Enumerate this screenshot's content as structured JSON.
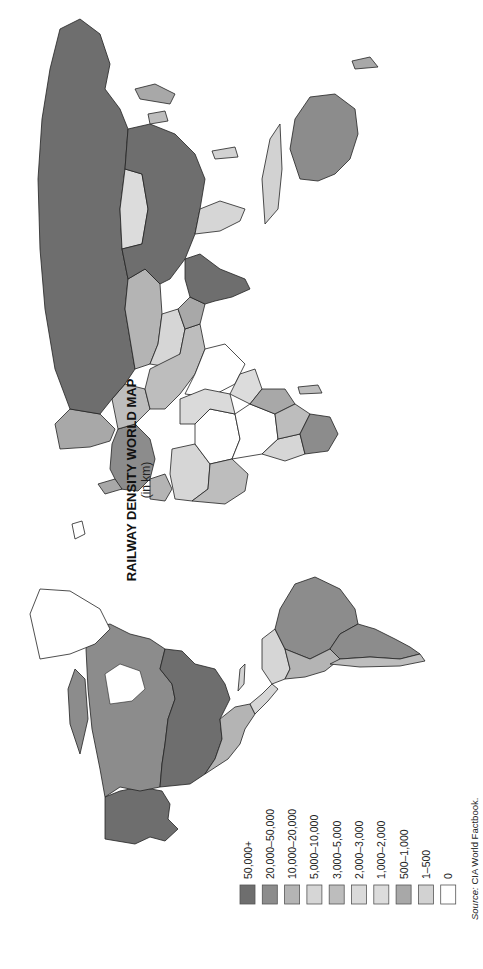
{
  "map": {
    "title": "RAILWAY DENSITY WORLD MAP",
    "subtitle": "(in km)",
    "orientation": "rotated 90° counter-clockwise",
    "source_prefix": "Source:",
    "source_text": " CIA World Factbook."
  },
  "legend": {
    "items": [
      {
        "label": "50,000+",
        "color": "#6e6e6e"
      },
      {
        "label": "20,000–50,000",
        "color": "#8c8c8c"
      },
      {
        "label": "10,000–20,000",
        "color": "#b4b4b4"
      },
      {
        "label": "5,000–10,000",
        "color": "#d6d6d6"
      },
      {
        "label": "3,000–5,000",
        "color": "#bdbdbd"
      },
      {
        "label": "2,000–3,000",
        "color": "#dadada"
      },
      {
        "label": "1,000–2,000",
        "color": "#dcdcdc"
      },
      {
        "label": "500–1,000",
        "color": "#a8a8a8"
      },
      {
        "label": "1–500",
        "color": "#d2d2d2"
      },
      {
        "label": "0",
        "color": "#ffffff"
      }
    ]
  },
  "regions": {
    "russia": "50,000+",
    "usa": "50,000+",
    "china": "50,000+",
    "india": "50,000+",
    "canada": "20,000–50,000",
    "australia": "20,000–50,000",
    "brazil": "20,000–50,000",
    "argentina": "20,000–50,000",
    "mexico": "10,000–20,000",
    "kazakhstan": "10,000–20,000",
    "south_africa": "20,000–50,000",
    "mongolia": "1,000–2,000",
    "greenland": "0"
  }
}
